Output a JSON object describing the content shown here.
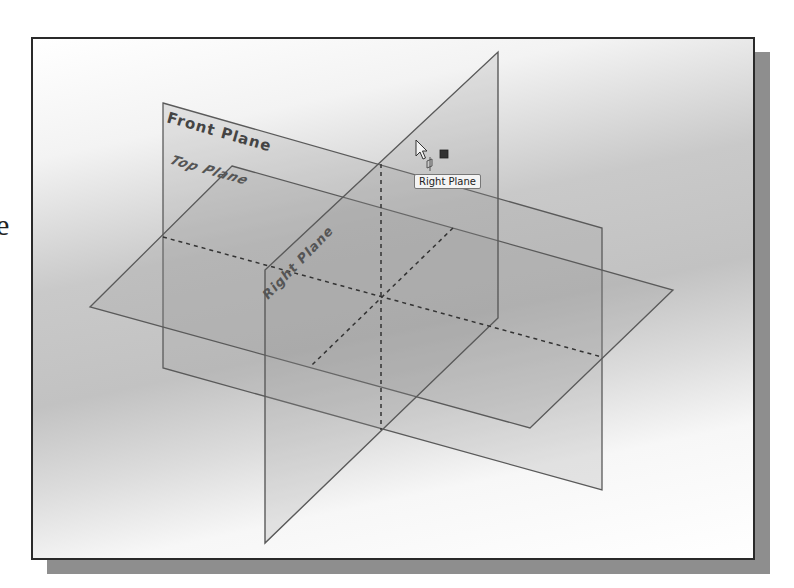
{
  "side_text": "e",
  "viewport": {
    "planes": [
      {
        "name": "Front Plane",
        "label": "Front Plane"
      },
      {
        "name": "Top Plane",
        "label": "Top Plane"
      },
      {
        "name": "Right Plane",
        "label": "Right Plane"
      }
    ],
    "tooltip": "Right Plane",
    "cursor": "arrow-pointer",
    "colors": {
      "plane_fill": "#b4b4b4",
      "plane_edge": "#5a5a5a",
      "frame_border": "#2a2a2a",
      "shadow": "#8e8e8e"
    }
  }
}
